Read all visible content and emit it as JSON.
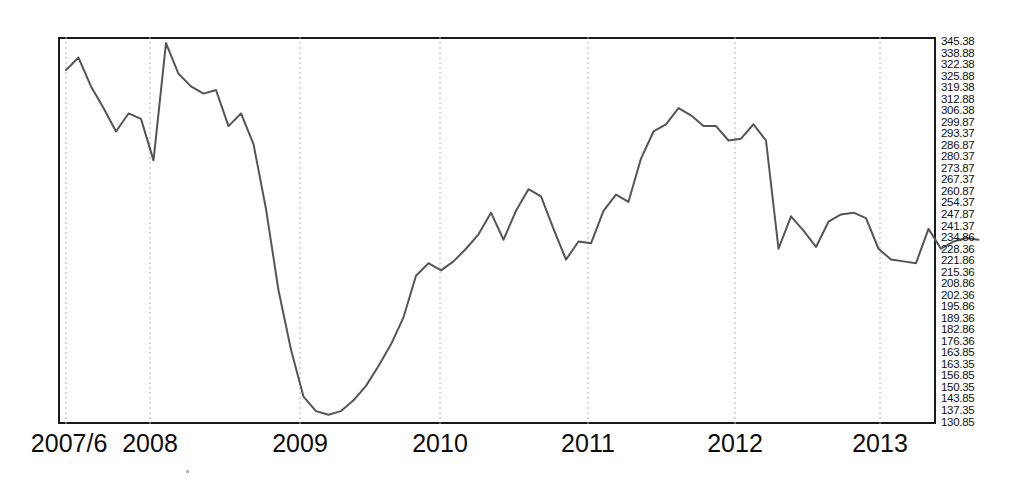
{
  "chart_data": {
    "type": "line",
    "title": "",
    "subtitle": "",
    "xlabel": "",
    "ylabel": "",
    "grid": true,
    "legend": null,
    "legend_position": "none",
    "line_color": "#555555",
    "frame_color": "#1a1a1a",
    "gridline_color": "#b0b0b0",
    "background": "#ffffff",
    "xlim": [
      "2007/6",
      "2013/7"
    ],
    "ylim": [
      130.85,
      345.38
    ],
    "x_tick_labels": [
      "2007/6",
      "2008",
      "2009",
      "2010",
      "2011",
      "2012",
      "2013"
    ],
    "y_tick_labels": [
      "345.38",
      "338.88",
      "322.38",
      "325.88",
      "319.38",
      "312.88",
      "306.38",
      "299.87",
      "293.37",
      "286.87",
      "280.37",
      "273.87",
      "267.37",
      "260.87",
      "254.37",
      "247.87",
      "241.37",
      "234.86",
      "228.36",
      "221.86",
      "215.36",
      "208.86",
      "202.36",
      "195.86",
      "189.36",
      "182.86",
      "176.36",
      "163.85",
      "163.35",
      "156.85",
      "150.35",
      "143.85",
      "137.35",
      "130.85"
    ],
    "x": [
      "2007/6",
      "2007/7",
      "2007/8",
      "2007/9",
      "2007/10",
      "2007/11",
      "2007/12",
      "2008/1",
      "2008/2",
      "2008/3",
      "2008/4",
      "2008/5",
      "2008/6",
      "2008/7",
      "2008/8",
      "2008/9",
      "2008/10",
      "2008/11",
      "2008/12",
      "2009/1",
      "2009/2",
      "2009/3",
      "2009/4",
      "2009/5",
      "2009/6",
      "2009/7",
      "2009/8",
      "2009/9",
      "2009/10",
      "2009/11",
      "2009/12",
      "2010/1",
      "2010/2",
      "2010/3",
      "2010/4",
      "2010/5",
      "2010/6",
      "2010/7",
      "2010/8",
      "2010/9",
      "2010/10",
      "2010/11",
      "2010/12",
      "2011/1",
      "2011/2",
      "2011/3",
      "2011/4",
      "2011/5",
      "2011/6",
      "2011/7",
      "2011/8",
      "2011/9",
      "2011/10",
      "2011/11",
      "2011/12",
      "2012/1",
      "2012/2",
      "2012/3",
      "2012/4",
      "2012/5",
      "2012/6",
      "2012/7",
      "2012/8",
      "2012/9",
      "2012/10",
      "2012/11",
      "2012/12",
      "2013/1",
      "2013/2",
      "2013/3",
      "2013/4",
      "2013/5",
      "2013/6",
      "2013/7"
    ],
    "values": [
      327.0,
      334.0,
      318.0,
      306.0,
      293.0,
      303.0,
      300.0,
      277.0,
      342.0,
      325.0,
      318.0,
      314.0,
      316.0,
      296.0,
      303.0,
      286.0,
      250.0,
      205.0,
      172.0,
      146.0,
      138.0,
      136.0,
      138.0,
      144.0,
      152.0,
      163.0,
      175.0,
      190.0,
      213.0,
      220.0,
      216.0,
      221.0,
      228.0,
      236.0,
      248.0,
      233.0,
      249.0,
      261.0,
      257.0,
      239.0,
      222.0,
      232.0,
      231.0,
      249.0,
      258.0,
      254.0,
      278.0,
      293.0,
      297.0,
      306.0,
      302.0,
      296.0,
      296.0,
      288.0,
      289.0,
      297.0,
      288.0,
      228.0,
      246.0,
      238.0,
      229.0,
      243.0,
      247.0,
      248.0,
      245.0,
      228.0,
      222.0,
      221.0,
      220.0,
      239.0,
      228.0,
      232.0,
      234.0,
      233.0
    ]
  },
  "axes": {
    "x_ticks": [
      {
        "label": "2007/6",
        "px": 66
      },
      {
        "label": "2008",
        "px": 150
      },
      {
        "label": "2009",
        "px": 300
      },
      {
        "label": "2010",
        "px": 440
      },
      {
        "label": "2011",
        "px": 588
      },
      {
        "label": "2012",
        "px": 735
      },
      {
        "label": "2013",
        "px": 880
      }
    ]
  }
}
